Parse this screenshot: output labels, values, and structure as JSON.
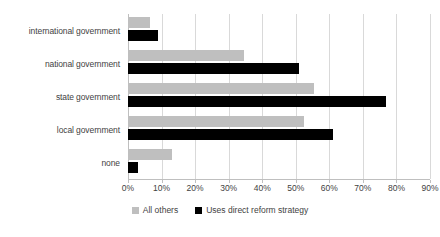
{
  "chart_data": {
    "type": "bar",
    "orientation": "horizontal",
    "title": "",
    "subtitle": "",
    "xlabel": "",
    "ylabel": "",
    "categories": [
      "international government",
      "national government",
      "state government",
      "local government",
      "none"
    ],
    "series": [
      {
        "name": "All others",
        "color": "#BFBFBF",
        "values": [
          6.5,
          34.5,
          55.5,
          52.5,
          13
        ]
      },
      {
        "name": "Uses direct reform strategy",
        "color": "#000000",
        "values": [
          9,
          51,
          77,
          61,
          3
        ]
      }
    ],
    "xlim": [
      0,
      90
    ],
    "xtick_values": [
      0,
      10,
      20,
      30,
      40,
      50,
      60,
      70,
      80,
      90
    ],
    "xtick_labels": [
      "0%",
      "10%",
      "20%",
      "30%",
      "40%",
      "50%",
      "60%",
      "70%",
      "80%",
      "90%"
    ],
    "value_suffix": "%",
    "grid": {
      "vertical": true,
      "horizontal": false,
      "color": "#D9D9D9"
    },
    "legend": {
      "position": "bottom",
      "entries": [
        "All others",
        "Uses direct reform strategy"
      ]
    },
    "annotations": []
  },
  "axis": {
    "x_tick_labels": [
      "0%",
      "10%",
      "20%",
      "30%",
      "40%",
      "50%",
      "60%",
      "70%",
      "80%",
      "90%"
    ]
  },
  "categories": [
    {
      "label": "international government"
    },
    {
      "label": "national government"
    },
    {
      "label": "state government"
    },
    {
      "label": "local government"
    },
    {
      "label": "none"
    }
  ],
  "legend": {
    "items": [
      {
        "label": "All others",
        "color": "#BFBFBF"
      },
      {
        "label": "Uses direct reform strategy",
        "color": "#000000"
      }
    ]
  }
}
